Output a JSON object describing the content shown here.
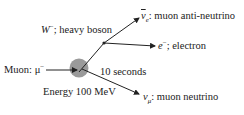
{
  "diagram": {
    "type": "particle-decay",
    "colors": {
      "line": "#222222",
      "decay_circle": "#9a9a9a",
      "text": "#222222"
    },
    "incoming": {
      "name": "Muon",
      "symbol": "μ",
      "charge": "−",
      "label_prefix": "Muon: "
    },
    "vertex_decay": {
      "lifetime_label": "10 seconds",
      "energy_label": "Energy 100 MeV"
    },
    "intermediate": {
      "symbol": "W",
      "charge": "−",
      "description": "; heavy boson"
    },
    "outgoing": [
      {
        "symbol": "ν",
        "subscript": "e",
        "bar": true,
        "description": ": muon anti-neutrino"
      },
      {
        "symbol": "e",
        "charge": "−",
        "description": "; electron"
      },
      {
        "symbol": "ν",
        "subscript": "μ",
        "bar": false,
        "description": ": muon neutrino"
      }
    ]
  }
}
